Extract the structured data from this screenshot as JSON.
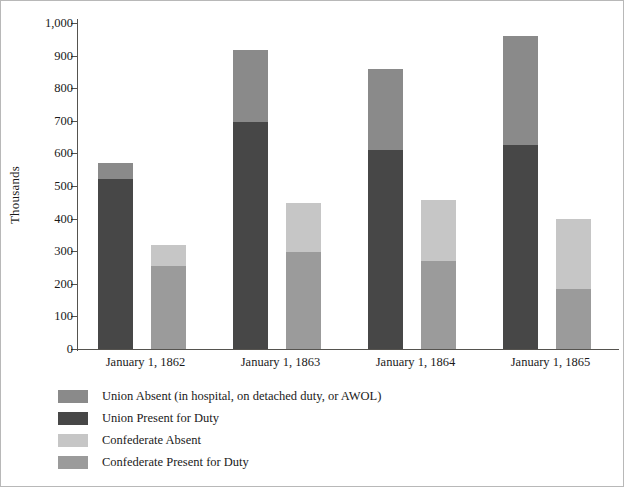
{
  "chart_data": {
    "type": "bar",
    "subtype": "grouped-stacked",
    "title": "",
    "subtitle": "",
    "xlabel": "",
    "ylabel": "Thousands",
    "ylim": [
      0,
      1000
    ],
    "ytick_labels": [
      "1,000",
      "900",
      "800",
      "700",
      "600",
      "500",
      "400",
      "300",
      "200",
      "100",
      "0"
    ],
    "ytick_values": [
      1000,
      900,
      800,
      700,
      600,
      500,
      400,
      300,
      200,
      100,
      0
    ],
    "grid": false,
    "legend_position": "below-left",
    "categories": [
      "January 1, 1862",
      "January 1, 1863",
      "January 1, 1864",
      "January 1, 1865"
    ],
    "series": [
      {
        "name": "Union Absent (in hospital, on detached duty, or AWOL)",
        "color": "#8a8a8a",
        "stack": "union",
        "values": [
          50,
          223,
          248,
          335
        ]
      },
      {
        "name": "Union Present for Duty",
        "color": "#474747",
        "stack": "union",
        "values": [
          520,
          695,
          612,
          625
        ]
      },
      {
        "name": "Confederate Absent",
        "color": "#c6c6c6",
        "stack": "confederate",
        "values": [
          65,
          150,
          188,
          213
        ]
      },
      {
        "name": "Confederate Present for Duty",
        "color": "#9b9b9b",
        "stack": "confederate",
        "values": [
          255,
          298,
          270,
          185
        ]
      }
    ],
    "stack_totals": {
      "union": [
        570,
        918,
        860,
        960
      ],
      "confederate": [
        320,
        448,
        458,
        398
      ]
    }
  },
  "axis": {
    "y_title": "Thousands"
  },
  "legend": {
    "items": [
      {
        "label": "Union Absent (in hospital, on detached duty, or AWOL)",
        "color": "#8a8a8a"
      },
      {
        "label": "Union Present for Duty",
        "color": "#474747"
      },
      {
        "label": "Confederate Absent",
        "color": "#c6c6c6"
      },
      {
        "label": "Confederate Present for Duty",
        "color": "#9b9b9b"
      }
    ]
  }
}
